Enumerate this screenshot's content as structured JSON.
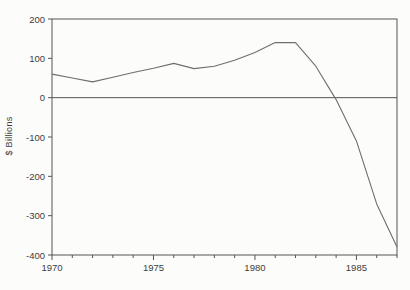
{
  "chart_data": {
    "type": "line",
    "title": "",
    "ylabel": "$ Billions",
    "xlabel": "",
    "x": [
      1970,
      1971,
      1972,
      1973,
      1974,
      1975,
      1976,
      1977,
      1978,
      1979,
      1980,
      1981,
      1982,
      1983,
      1984,
      1985,
      1986,
      1987
    ],
    "values": [
      60,
      50,
      40,
      52,
      64,
      75,
      87,
      74,
      80,
      95,
      115,
      140,
      140,
      80,
      -5,
      -110,
      -270,
      -380
    ],
    "ylim": [
      -400,
      200
    ],
    "xlim": [
      1970,
      1987
    ],
    "yticks": [
      200,
      100,
      0,
      -100,
      -200,
      -300,
      -400
    ],
    "ytick_labels": [
      "200",
      "100",
      "0",
      "-100",
      "-200",
      "-300",
      "-400"
    ],
    "xticks_major": [
      1970,
      1975,
      1980,
      1985
    ],
    "xtick_labels": [
      "1970",
      "1975",
      "1980",
      "1985"
    ],
    "xticks_minor_step": 1,
    "zero_reference_line": true,
    "grid": false,
    "legend": "none",
    "line_color": "#6e6e6e",
    "axis_color": "#555550",
    "background": "#fcfcfa"
  }
}
